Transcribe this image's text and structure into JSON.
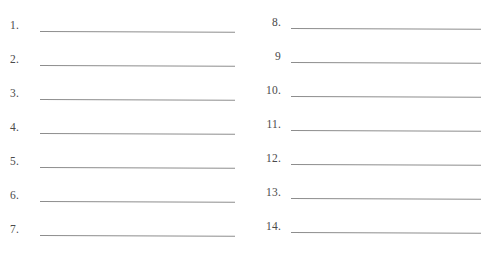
{
  "document": {
    "title": "Numbered answer worksheet",
    "background_color": "#ffffff",
    "rule_color": "#8d8d8d",
    "text_color": "#4a4a4a"
  },
  "columns": [
    {
      "name": "left-column",
      "entries": [
        {
          "label": "1."
        },
        {
          "label": "2."
        },
        {
          "label": "3."
        },
        {
          "label": "4."
        },
        {
          "label": "5."
        },
        {
          "label": "6."
        },
        {
          "label": "7."
        }
      ]
    },
    {
      "name": "right-column",
      "entries": [
        {
          "label": "8."
        },
        {
          "label": "9"
        },
        {
          "label": "10."
        },
        {
          "label": "11."
        },
        {
          "label": "12."
        },
        {
          "label": "13."
        },
        {
          "label": "14."
        }
      ]
    }
  ]
}
